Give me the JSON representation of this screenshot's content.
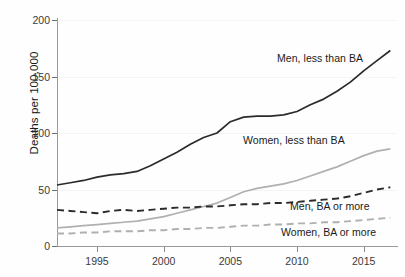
{
  "chart_data": {
    "type": "line",
    "title": "",
    "xlabel": "",
    "ylabel": "Deaths per 100,000",
    "xlim": [
      1992,
      2017.5
    ],
    "ylim": [
      0,
      200
    ],
    "grid": true,
    "legend_position": "inline-annotations",
    "xticks": [
      1995,
      2000,
      2005,
      2010,
      2015
    ],
    "yticks": [
      0,
      50,
      100,
      150,
      200
    ],
    "x": [
      1992,
      1993,
      1994,
      1995,
      1996,
      1997,
      1998,
      1999,
      2000,
      2001,
      2002,
      2003,
      2004,
      2005,
      2006,
      2007,
      2008,
      2009,
      2010,
      2011,
      2012,
      2013,
      2014,
      2015,
      2016,
      2017
    ],
    "series": [
      {
        "name": "Men, less than BA",
        "style": "solid",
        "color": "#2b2b2b",
        "values": [
          54,
          56,
          58,
          61,
          63,
          64,
          66,
          71,
          77,
          83,
          90,
          96,
          100,
          110,
          114,
          115,
          115,
          116,
          119,
          125,
          130,
          137,
          145,
          155,
          164,
          173
        ]
      },
      {
        "name": "Women, less than BA",
        "style": "solid",
        "color": "#b0b0b0",
        "values": [
          16,
          17,
          18,
          19,
          20,
          21,
          22,
          24,
          26,
          29,
          32,
          35,
          38,
          43,
          48,
          51,
          53,
          55,
          58,
          62,
          66,
          70,
          75,
          80,
          84,
          86
        ]
      },
      {
        "name": "Men, BA or more",
        "style": "dashed",
        "color": "#2b2b2b",
        "values": [
          32,
          31,
          30,
          29,
          31,
          32,
          31,
          32,
          33,
          34,
          34,
          35,
          35,
          36,
          37,
          37,
          38,
          38,
          39,
          40,
          41,
          42,
          44,
          47,
          50,
          52
        ]
      },
      {
        "name": "Women, BA or more",
        "style": "dashed",
        "color": "#b0b0b0",
        "values": [
          11,
          11,
          12,
          12,
          13,
          13,
          13,
          14,
          14,
          15,
          15,
          16,
          16,
          17,
          18,
          18,
          19,
          19,
          20,
          20,
          21,
          21,
          22,
          23,
          24,
          25
        ]
      }
    ],
    "annotations": [
      {
        "text": "Men, less than BA",
        "x_px": 277,
        "y_px": 52
      },
      {
        "text": "Women, less than BA",
        "x_px": 243,
        "y_px": 134
      },
      {
        "text": "Men, BA or more",
        "x_px": 290,
        "y_px": 200
      },
      {
        "text": "Women, BA or more",
        "x_px": 281,
        "y_px": 226
      }
    ]
  }
}
